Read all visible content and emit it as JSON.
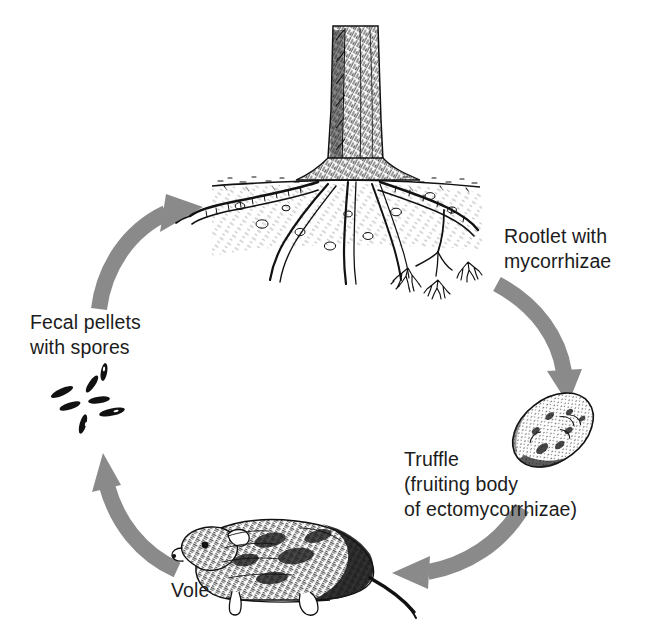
{
  "figure": {
    "type": "cycle-diagram",
    "background_color": "#ffffff",
    "arrow_color": "#8a8a8a",
    "text_color": "#1c1c1c",
    "ink_color": "#111111",
    "cycle_direction": "clockwise"
  },
  "labels": {
    "rootlet": "Rootlet with\nmycorrhizae",
    "truffle": "Truffle\n(fruiting body\nof ectomycorrhizae)",
    "vole": "Vole",
    "fecal": "Fecal pellets\nwith spores"
  },
  "nodes": [
    {
      "id": "tree",
      "name": "conifer-tree-with-roots",
      "label": "Rootlet with mycorrhizae",
      "position": "top"
    },
    {
      "id": "truffle",
      "name": "truffle-tuber",
      "label": "Truffle (fruiting body of ectomycorrhizae)",
      "position": "right"
    },
    {
      "id": "vole",
      "name": "vole-rodent",
      "label": "Vole",
      "position": "bottom"
    },
    {
      "id": "pellets",
      "name": "fecal-pellets",
      "label": "Fecal pellets with spores",
      "position": "left"
    }
  ],
  "arrows": [
    {
      "id": "arrow-tree-to-truffle",
      "from": "tree",
      "to": "truffle",
      "position": "upper-right",
      "direction": "down"
    },
    {
      "id": "arrow-truffle-to-vole",
      "from": "truffle",
      "to": "vole",
      "position": "lower-right",
      "direction": "left"
    },
    {
      "id": "arrow-vole-to-pellets",
      "from": "vole",
      "to": "pellets",
      "position": "lower-left",
      "direction": "up"
    },
    {
      "id": "arrow-pellets-to-tree",
      "from": "pellets",
      "to": "tree",
      "position": "upper-left",
      "direction": "up-right"
    }
  ]
}
